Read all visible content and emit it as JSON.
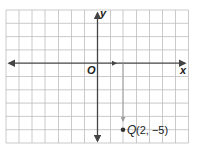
{
  "graph": {
    "x_axis_label": "x",
    "y_axis_label": "y",
    "origin_label": "O",
    "grid": {
      "x_min": -7,
      "x_max": 7,
      "y_min": -6,
      "y_max": 4,
      "cell_px_x": 13,
      "cell_px_y": 13.3
    },
    "colors": {
      "grid": "#bdbdbd",
      "axis": "#444444",
      "translation_arrow": "#9e9e9e",
      "point": "#333333"
    },
    "point": {
      "name": "Q",
      "x": 2,
      "y": -5,
      "coords_text": "(2, −5)"
    },
    "translation": {
      "from": [
        2,
        0
      ],
      "to": [
        2,
        -4
      ]
    }
  }
}
